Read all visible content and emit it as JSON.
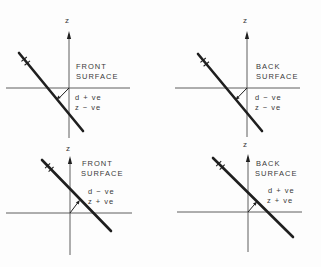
{
  "figure": {
    "colors": {
      "background": "#fdfdfd",
      "thin_line": "#4d4d4d",
      "heavy_line": "#1f1f1f",
      "text": "#3a3a3a"
    },
    "panels": [
      {
        "position": "top-left",
        "axis_label": "z",
        "title_line1": "FRONT",
        "title_line2": "SURFACE",
        "value_line1": "d + ve",
        "value_line2": "z − ve"
      },
      {
        "position": "top-right",
        "axis_label": "z",
        "title_line1": "BACK",
        "title_line2": "SURFACE",
        "value_line1": "d − ve",
        "value_line2": "z − ve"
      },
      {
        "position": "bottom-left",
        "axis_label": "z",
        "title_line1": "FRONT",
        "title_line2": "SURFACE",
        "value_line1": "d − ve",
        "value_line2": "z + ve"
      },
      {
        "position": "bottom-right",
        "axis_label": "z",
        "title_line1": "BACK",
        "title_line2": "SURFACE",
        "value_line1": "d + ve",
        "value_line2": "z + ve"
      }
    ]
  }
}
